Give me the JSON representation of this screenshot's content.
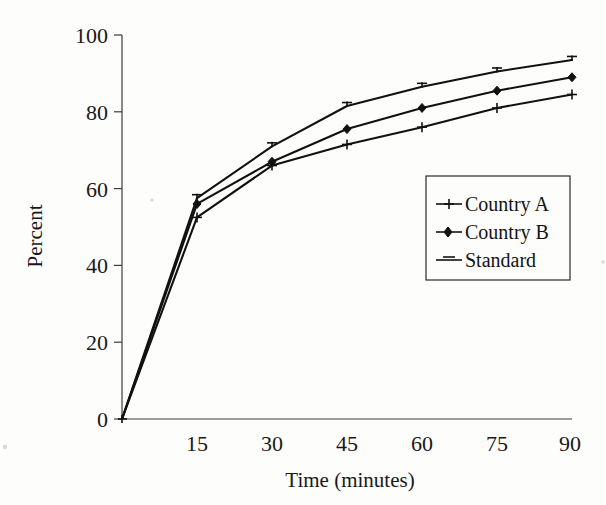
{
  "chart_data": {
    "type": "line",
    "title": "",
    "subtitle": "",
    "xlabel": "Time (minutes)",
    "ylabel": "Percent",
    "x": [
      0,
      15,
      30,
      45,
      60,
      75,
      90
    ],
    "xtick_labels": [
      "15",
      "30",
      "45",
      "60",
      "75",
      "90"
    ],
    "xtick_values": [
      15,
      30,
      45,
      60,
      75,
      90
    ],
    "ytick_labels": [
      "0",
      "20",
      "40",
      "60",
      "80",
      "100"
    ],
    "ytick_values": [
      0,
      20,
      40,
      60,
      80,
      100
    ],
    "xlim": [
      0,
      90
    ],
    "ylim": [
      0,
      100
    ],
    "grid": false,
    "legend_position": "center-right",
    "series": [
      {
        "name": "Country A",
        "marker": "plus",
        "color": "#111111",
        "values": [
          0,
          52.5,
          66,
          71.5,
          76,
          81,
          84.5
        ]
      },
      {
        "name": "Country B",
        "marker": "diamond",
        "color": "#111111",
        "values": [
          0,
          56,
          67,
          75.5,
          81,
          85.5,
          89
        ]
      },
      {
        "name": "Standard",
        "marker": "dash",
        "color": "#111111",
        "values": [
          0,
          57.5,
          71,
          81.5,
          86.5,
          90.5,
          93.5
        ]
      }
    ]
  },
  "axes": {
    "y_title": "Percent",
    "x_title": "Time (minutes)",
    "y_ticks": [
      "100",
      "80",
      "60",
      "40",
      "20",
      "0"
    ],
    "x_ticks": [
      "15",
      "30",
      "45",
      "60",
      "75",
      "90"
    ]
  },
  "legend": {
    "entries": [
      {
        "label": "Country A",
        "marker": "plus-marker"
      },
      {
        "label": "Country B",
        "marker": "diamond-marker"
      },
      {
        "label": "Standard",
        "marker": "dash-marker"
      }
    ]
  }
}
